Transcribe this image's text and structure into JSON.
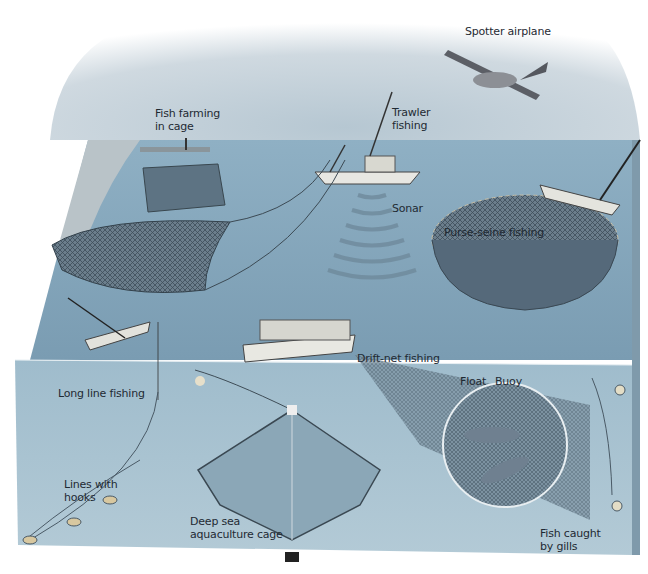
{
  "diagram": {
    "labels": {
      "spotter_airplane": "Spotter airplane",
      "fish_farming": "Fish farming\nin cage",
      "trawler": "Trawler\nfishing",
      "sonar": "Sonar",
      "purse_seine": "Purse-seine fishing",
      "drift_net": "Drift-net fishing",
      "long_line": "Long line fishing",
      "lines_hooks": "Lines with\nhooks",
      "deep_sea_cage": "Deep sea\naquaculture cage",
      "float": "Float",
      "buoy": "Buoy",
      "fish_gills": "Fish caught\nby gills"
    },
    "colors": {
      "sky": "#c9d4dc",
      "sea_surface": "#7d9fb5",
      "underwater": "#9db8c8",
      "side_face": "#8eabbd",
      "net": "#4c5d6a",
      "label_text": "#1f2a33"
    }
  }
}
